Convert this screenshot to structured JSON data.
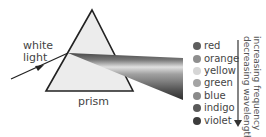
{
  "labels": {
    "incoming": [
      "white",
      "light"
    ],
    "prism": "prism"
  },
  "legend": {
    "items": [
      {
        "label": "red",
        "color": "#5e5e5e"
      },
      {
        "label": "orange",
        "color": "#8e8e8e"
      },
      {
        "label": "yellow",
        "color": "#d6d6d6"
      },
      {
        "label": "green",
        "color": "#a4a4a4"
      },
      {
        "label": "blue",
        "color": "#8a8a8a"
      },
      {
        "label": "indigo",
        "color": "#5a5a5a"
      },
      {
        "label": "violet",
        "color": "#3c3c3c"
      }
    ]
  },
  "axis": {
    "line1": "increasing frequency",
    "line2": "decreasing wavelength"
  },
  "colors": {
    "prism_fill": "#ececec",
    "outline": "#222222",
    "text": "#444444"
  }
}
